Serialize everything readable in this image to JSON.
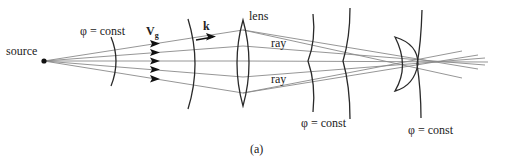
{
  "figure": {
    "caption": "(a)",
    "labels": {
      "source": "source",
      "phi_first": "φ = const",
      "group_velocity": "V",
      "group_velocity_sub": "g",
      "wave_vector": "k",
      "lens": "lens",
      "ray_upper": "ray",
      "ray_lower": "ray",
      "phi_middle": "φ = const",
      "phi_right": "φ = const"
    },
    "colors": {
      "ray": "#8a8a8a",
      "wavefront": "#2a2a2a",
      "text": "#222222"
    }
  }
}
